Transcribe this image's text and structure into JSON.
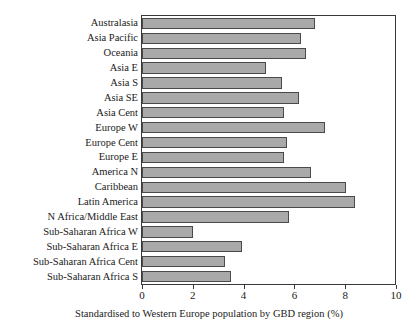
{
  "chart_data": {
    "type": "bar",
    "orientation": "horizontal",
    "title": "",
    "xlabel": "Standardised to Western Europe population by GBD region (%)",
    "ylabel": "",
    "xlim": [
      0,
      10
    ],
    "xticks": [
      0,
      2,
      4,
      6,
      8,
      10
    ],
    "xtick_labels": [
      "0",
      "2",
      "4",
      "6",
      "8",
      "10"
    ],
    "grid": false,
    "legend": false,
    "bar_color": "#a9a9a9",
    "bar_edge_color": "#4a4a4a",
    "categories": [
      "Australasia",
      "Asia Pacific",
      "Oceania",
      "Asia E",
      "Asia S",
      "Asia SE",
      "Asia Cent",
      "Europe W",
      "Europe Cent",
      "Europe E",
      "America N",
      "Caribbean",
      "Latin America",
      "N Africa/Middle East",
      "Sub-Saharan Africa W",
      "Sub-Saharan Africa E",
      "Sub-Saharan Africa Cent",
      "Sub-Saharan Africa S"
    ],
    "values": [
      6.8,
      6.25,
      6.45,
      4.9,
      5.5,
      6.2,
      5.6,
      7.2,
      5.7,
      5.6,
      6.65,
      8.05,
      8.4,
      5.8,
      2.0,
      3.95,
      3.25,
      3.5
    ]
  }
}
